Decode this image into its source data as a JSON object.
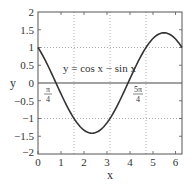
{
  "chart_data": {
    "type": "line",
    "title": "",
    "xlabel": "x",
    "ylabel": "y",
    "xlim": [
      0,
      6.2832
    ],
    "ylim": [
      -2,
      2
    ],
    "xticks": [
      "0",
      "1",
      "2",
      "3",
      "4",
      "5",
      "6"
    ],
    "yticks": [
      "2",
      "1.5",
      "1",
      "0.5",
      "0",
      "-0.5",
      "-1",
      "-1.5",
      "-2"
    ],
    "grid": {
      "vertical_dotted_at": [
        1.5708,
        3.1416,
        4.7124
      ],
      "horizontal_dotted_at": [
        1,
        -1
      ],
      "zero_line_solid": true
    },
    "series": [
      {
        "name": "y = cos x - sin x",
        "function": "cos(x) - sin(x)",
        "x": [
          0,
          0.7854,
          1.5708,
          2.3562,
          3.1416,
          3.927,
          4.7124,
          5.4978,
          6.2832
        ],
        "values": [
          1,
          0,
          -1,
          -1.414,
          -1,
          0,
          1,
          1.414,
          1
        ]
      }
    ],
    "annotations": [
      {
        "text": "y = cos x − sin x",
        "x": 1.3,
        "y": 0.5
      },
      {
        "text": "π/4",
        "x": 0.7854,
        "y": -0.25,
        "meaning": "root"
      },
      {
        "text": "5π/4",
        "x": 3.927,
        "y": -0.25,
        "meaning": "root"
      }
    ]
  },
  "labels": {
    "xlabel": "x",
    "ylabel": "y",
    "equation": "y = cos x − sin x",
    "root1_num": "π",
    "root1_den": "4",
    "root2_num": "5π",
    "root2_den": "4"
  },
  "xticks": [
    "0",
    "1",
    "2",
    "3",
    "4",
    "5",
    "6"
  ],
  "yticks": [
    "2",
    "1.5",
    "1",
    "0.5",
    "0",
    "−0.5",
    "−1",
    "−1.5",
    "−2"
  ]
}
